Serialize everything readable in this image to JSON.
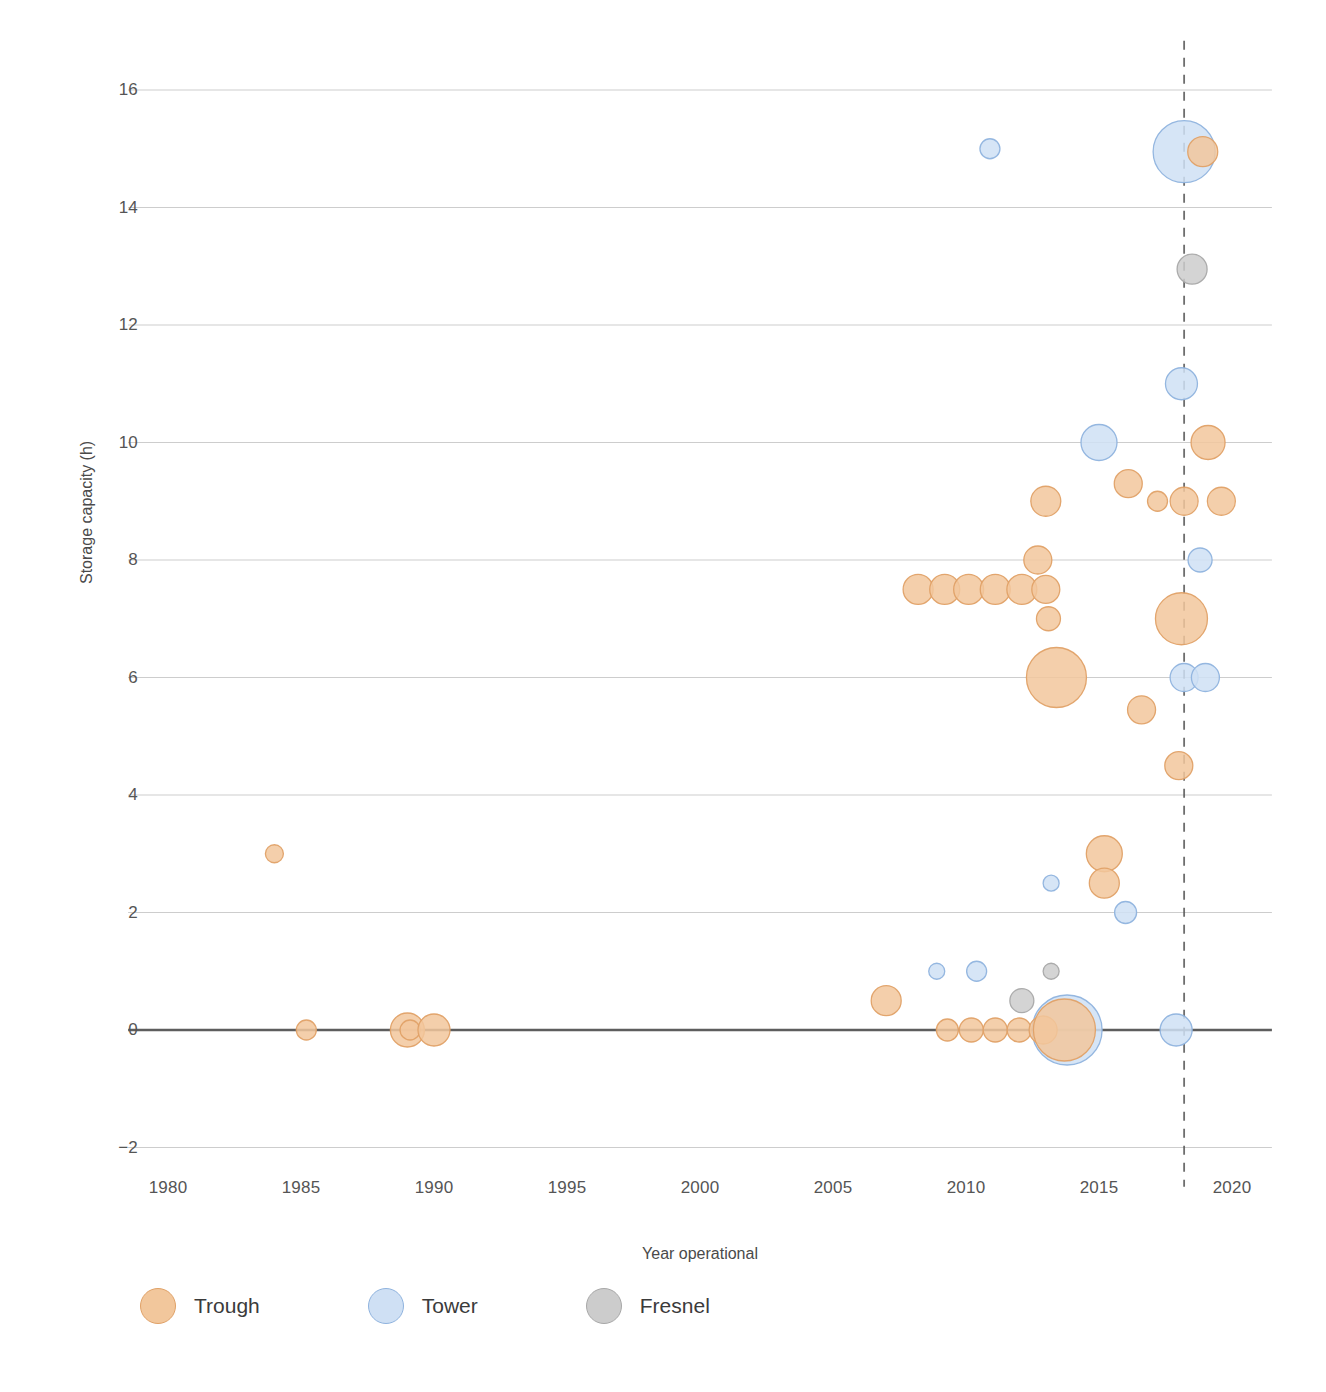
{
  "chart_data": {
    "type": "scatter",
    "title": "",
    "xlabel": "Year operational",
    "ylabel": "Storage capacity (h)",
    "xlim": [
      1978.5,
      2021.5
    ],
    "ylim": [
      -2.6,
      16.6
    ],
    "xticks": [
      1980,
      1985,
      1990,
      1995,
      2000,
      2005,
      2010,
      2015,
      2020
    ],
    "yticks": [
      -2,
      0,
      2,
      4,
      6,
      8,
      10,
      12,
      14,
      16
    ],
    "grid": "horizontal",
    "legend_position": "bottom-left",
    "size_encoding": "bubble area = plant capacity (MW)",
    "annotations": [
      {
        "name": "reference-line",
        "type": "vertical-dashed",
        "x": 2018.2
      }
    ],
    "series": [
      {
        "name": "Trough",
        "color": "#f2c79c",
        "edge_color": "#e0a167",
        "points": [
          {
            "x": 1984.0,
            "y": 3.0,
            "r": 9
          },
          {
            "x": 1985.2,
            "y": 0.0,
            "r": 10
          },
          {
            "x": 1989.0,
            "y": 0.0,
            "r": 17
          },
          {
            "x": 1989.1,
            "y": 0.0,
            "r": 10
          },
          {
            "x": 1990.0,
            "y": 0.0,
            "r": 16
          },
          {
            "x": 2007.0,
            "y": 0.5,
            "r": 15
          },
          {
            "x": 2009.3,
            "y": 0.0,
            "r": 11
          },
          {
            "x": 2010.2,
            "y": 0.0,
            "r": 12
          },
          {
            "x": 2011.1,
            "y": 0.0,
            "r": 12
          },
          {
            "x": 2012.0,
            "y": 0.0,
            "r": 12
          },
          {
            "x": 2012.9,
            "y": 0.0,
            "r": 14
          },
          {
            "x": 2013.7,
            "y": 0.0,
            "r": 31
          },
          {
            "x": 2008.2,
            "y": 7.5,
            "r": 15
          },
          {
            "x": 2009.2,
            "y": 7.5,
            "r": 15
          },
          {
            "x": 2010.1,
            "y": 7.5,
            "r": 15
          },
          {
            "x": 2011.1,
            "y": 7.5,
            "r": 15
          },
          {
            "x": 2012.1,
            "y": 7.5,
            "r": 15
          },
          {
            "x": 2013.0,
            "y": 7.5,
            "r": 14
          },
          {
            "x": 2012.7,
            "y": 8.0,
            "r": 14
          },
          {
            "x": 2013.1,
            "y": 7.0,
            "r": 12
          },
          {
            "x": 2013.4,
            "y": 6.0,
            "r": 30
          },
          {
            "x": 2018.1,
            "y": 7.0,
            "r": 26
          },
          {
            "x": 2013.0,
            "y": 9.0,
            "r": 15
          },
          {
            "x": 2016.1,
            "y": 9.3,
            "r": 14
          },
          {
            "x": 2017.2,
            "y": 9.0,
            "r": 10
          },
          {
            "x": 2018.2,
            "y": 9.0,
            "r": 14
          },
          {
            "x": 2019.6,
            "y": 9.0,
            "r": 14
          },
          {
            "x": 2019.1,
            "y": 10.0,
            "r": 17
          },
          {
            "x": 2016.6,
            "y": 5.45,
            "r": 14
          },
          {
            "x": 2018.0,
            "y": 4.5,
            "r": 14
          },
          {
            "x": 2015.2,
            "y": 3.0,
            "r": 18
          },
          {
            "x": 2015.2,
            "y": 2.5,
            "r": 15
          },
          {
            "x": 2018.9,
            "y": 14.95,
            "r": 15
          }
        ]
      },
      {
        "name": "Tower",
        "color": "#cfe0f4",
        "edge_color": "#8fb3de",
        "points": [
          {
            "x": 2010.9,
            "y": 15.0,
            "r": 10
          },
          {
            "x": 2018.2,
            "y": 14.95,
            "r": 31
          },
          {
            "x": 2018.1,
            "y": 11.0,
            "r": 16
          },
          {
            "x": 2015.0,
            "y": 10.0,
            "r": 18
          },
          {
            "x": 2018.8,
            "y": 8.0,
            "r": 12
          },
          {
            "x": 2018.2,
            "y": 6.0,
            "r": 14
          },
          {
            "x": 2019.0,
            "y": 6.0,
            "r": 14
          },
          {
            "x": 2016.0,
            "y": 2.0,
            "r": 11
          },
          {
            "x": 2013.2,
            "y": 2.5,
            "r": 8
          },
          {
            "x": 2008.9,
            "y": 1.0,
            "r": 8
          },
          {
            "x": 2010.4,
            "y": 1.0,
            "r": 10
          },
          {
            "x": 2013.8,
            "y": 0.0,
            "r": 35
          },
          {
            "x": 2017.9,
            "y": 0.0,
            "r": 16
          }
        ]
      },
      {
        "name": "Fresnel",
        "color": "#cccccc",
        "edge_color": "#a8a8a8",
        "points": [
          {
            "x": 2018.5,
            "y": 12.95,
            "r": 15
          },
          {
            "x": 2013.2,
            "y": 1.0,
            "r": 8
          },
          {
            "x": 2012.1,
            "y": 0.5,
            "r": 12
          }
        ]
      }
    ]
  },
  "axes": {
    "y_label": "Storage capacity (h)",
    "x_label": "Year operational",
    "y_ticks": [
      "16",
      "14",
      "12",
      "10",
      "8",
      "6",
      "4",
      "2",
      "0",
      "−2"
    ],
    "x_ticks": [
      "1980",
      "1985",
      "1990",
      "1995",
      "2000",
      "2005",
      "2010",
      "2015",
      "2020"
    ]
  },
  "legend": {
    "items": [
      {
        "label": "Trough",
        "color": "#f2c79c",
        "edge": "#e0a167"
      },
      {
        "label": "Tower",
        "color": "#cfe0f4",
        "edge": "#8fb3de"
      },
      {
        "label": "Fresnel",
        "color": "#cccccc",
        "edge": "#a8a8a8"
      }
    ]
  },
  "colors": {
    "grid": "#9a9a9a",
    "zero_line": "#555555",
    "reference_line": "#555555",
    "text": "#4a4a4a",
    "background": "#ffffff"
  }
}
